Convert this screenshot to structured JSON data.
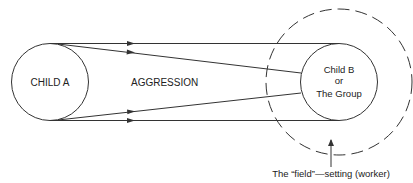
{
  "diagram": {
    "nodes": {
      "child_a": {
        "label": "CHILD A"
      },
      "child_b": {
        "lines": [
          "Child B",
          "or",
          "The Group"
        ]
      }
    },
    "relation": {
      "label": "AGGRESSION",
      "direction": "Child A → Child B / The Group"
    },
    "field": {
      "caption": "The “field”—setting (worker)"
    },
    "colors": {
      "stroke": "#333333",
      "text": "#222222",
      "background": "#ffffff"
    }
  }
}
